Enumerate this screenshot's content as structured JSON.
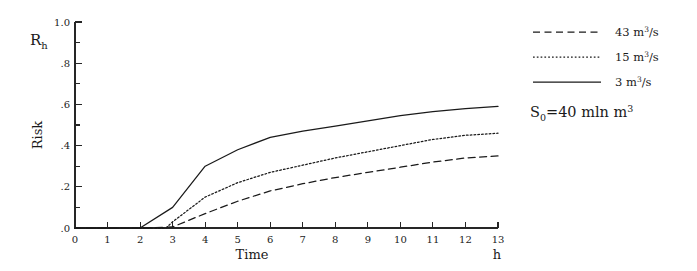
{
  "chart_data": {
    "type": "line",
    "title": "",
    "subtitle": "",
    "xlabel": "Time",
    "xunit": "h",
    "ylabel": "Risk",
    "ysymbol": "R",
    "ysymbol_sub": "h",
    "xlim": [
      0,
      13
    ],
    "ylim": [
      0,
      1.0
    ],
    "grid": false,
    "legend_position": "right",
    "x_tick_labels": [
      "0",
      "1",
      "2",
      "3",
      "4",
      "5",
      "6",
      "7",
      "8",
      "9",
      "10",
      "11",
      "12",
      "13"
    ],
    "x_ticks": [
      0,
      1,
      2,
      3,
      4,
      5,
      6,
      7,
      8,
      9,
      10,
      11,
      12,
      13
    ],
    "y_tick_labels": [
      ".0",
      ".2",
      ".4",
      ".6",
      ".8",
      "1.0"
    ],
    "y_ticks": [
      0.0,
      0.2,
      0.4,
      0.6,
      0.8,
      1.0
    ],
    "y_minor_ticks": [
      0.1,
      0.3,
      0.5,
      0.7,
      0.9
    ],
    "annotations": [
      {
        "name": "initial-storage",
        "text": "S0=40 mln m3",
        "display": "S₀=40 mln m³",
        "symbol": "S",
        "symbol_sub": "0",
        "value": "=40 mln m",
        "sup": "3"
      }
    ],
    "series": [
      {
        "name": "43 m3/s",
        "label": "43 m",
        "label_sup": "3",
        "label_tail": "/s",
        "style": "dashed",
        "color": "#1a1a1a",
        "x": [
          0,
          1,
          2,
          3,
          4,
          5,
          6,
          7,
          8,
          9,
          10,
          11,
          12,
          13
        ],
        "y": [
          0,
          0,
          0,
          0.005,
          0.07,
          0.13,
          0.18,
          0.215,
          0.245,
          0.27,
          0.295,
          0.32,
          0.34,
          0.35
        ]
      },
      {
        "name": "15 m3/s",
        "label": "15 m",
        "label_sup": "3",
        "label_tail": "/s",
        "style": "dotted",
        "color": "#1a1a1a",
        "x": [
          0,
          1,
          2,
          2.8,
          3,
          4,
          5,
          6,
          7,
          8,
          9,
          10,
          11,
          12,
          13
        ],
        "y": [
          0,
          0,
          0,
          0,
          0.03,
          0.15,
          0.22,
          0.27,
          0.305,
          0.34,
          0.37,
          0.4,
          0.43,
          0.45,
          0.46
        ]
      },
      {
        "name": "3 m3/s",
        "label": "3 m",
        "label_sup": "3",
        "label_tail": "/s",
        "style": "solid",
        "color": "#1a1a1a",
        "x": [
          0,
          1,
          2,
          3,
          4,
          5,
          6,
          7,
          8,
          9,
          10,
          11,
          12,
          13
        ],
        "y": [
          0,
          0,
          0,
          0.1,
          0.3,
          0.38,
          0.44,
          0.47,
          0.495,
          0.52,
          0.545,
          0.565,
          0.58,
          0.59
        ]
      }
    ]
  }
}
